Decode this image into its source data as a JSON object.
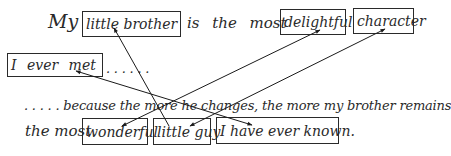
{
  "line1": {
    "lead": "My",
    "box_little_brother": "little brother",
    "middle": "is the most",
    "box_delightful": "delightful",
    "box_character": "character"
  },
  "line2": {
    "box_i_ever_met": "I ever met",
    "trailing_dots": ". . . . . ."
  },
  "line3": {
    "text": ". . . . . because the more he changes, the more my brother remains"
  },
  "line4": {
    "lead": "the most",
    "box_wonderful": "wonderful",
    "box_little_guy": "little guy",
    "box_i_have_ever_known": "I have ever known."
  },
  "arrows": [
    {
      "from": "little guy",
      "to": "little brother"
    },
    {
      "from": "I ever met",
      "to": "I have ever known."
    },
    {
      "from": "wonderful",
      "to": "delightful"
    },
    {
      "from": "little guy",
      "to": "character"
    }
  ],
  "colors": {
    "ink": "#2a2a2a",
    "background": "#ffffff"
  }
}
